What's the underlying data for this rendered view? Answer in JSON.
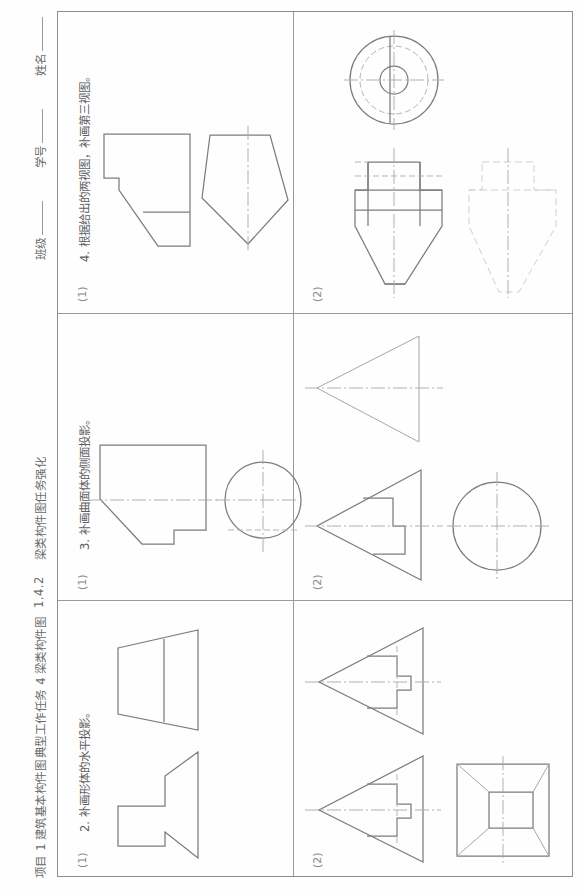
{
  "header": {
    "project": "项目 1",
    "project_title": "建筑基本构件图",
    "typical_task": "典型工作任务 4",
    "typical_task_title": "梁类构件图",
    "section_no": "1.4.2",
    "section_title": "梁类构件图任务强化",
    "field_class": "班级",
    "field_student_id": "学号",
    "field_name": "姓名"
  },
  "tasks": [
    {
      "number": "2.",
      "prompt": "补画形体的水平投影。",
      "subparts": [
        {
          "label": "(1)"
        },
        {
          "label": "(2)"
        }
      ]
    },
    {
      "number": "3.",
      "prompt": "补画曲面体的侧面投影。",
      "subparts": [
        {
          "label": "(1)"
        },
        {
          "label": "(2)"
        }
      ]
    },
    {
      "number": "4.",
      "prompt": "根据给出的两视图，补画第三视图。",
      "subparts": [
        {
          "label": "(1)"
        },
        {
          "label": "(2)"
        }
      ]
    }
  ]
}
